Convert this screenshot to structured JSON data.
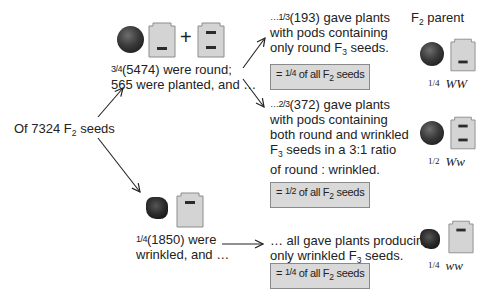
{
  "header": {
    "parent_label": "F",
    "parent_sub": "2",
    "parent_suffix": " parent"
  },
  "root": {
    "prefix": "Of 7324 F",
    "sub": "2",
    "suffix": " seeds"
  },
  "round_branch": {
    "frac": "3/4",
    "line1": "(5474) were round;",
    "line2": "565 were planted, and …",
    "plus": "+"
  },
  "wrinkled_branch": {
    "frac": "1/4",
    "line1": "(1850) were",
    "line2": "wrinkled, and …"
  },
  "outcomes": [
    {
      "lead": "…",
      "frac": "1/3",
      "line1": "(193) gave plants",
      "line2": "with pods containing",
      "line3_pre": "only round F",
      "line3_sub": "3",
      "line3_post": " seeds.",
      "box_pre": "= ",
      "box_frac": "1/4",
      "box_mid": " of all F",
      "box_sub": "2",
      "box_post": " seeds",
      "genotype_frac": "1/4",
      "genotype": "WW"
    },
    {
      "lead": "…",
      "frac": "2/3",
      "line1": "(372) gave plants",
      "line2": "with pods containing",
      "line3": "both round and wrinkled",
      "line4_pre": "F",
      "line4_sub": "3",
      "line4_post": " seeds in a 3:1 ratio",
      "line5": "of round : wrinkled.",
      "box_pre": "= ",
      "box_frac": "1/2",
      "box_mid": " of all F",
      "box_sub": "2",
      "box_post": " seeds",
      "genotype_frac": "1/2",
      "genotype": "Ww"
    },
    {
      "line1": "… all gave plants producing",
      "line2_pre": "only wrinkled F",
      "line2_sub": "3",
      "line2_post": " seeds.",
      "box_pre": "= ",
      "box_frac": "1/4",
      "box_mid": " of all F",
      "box_sub": "2",
      "box_post": " seeds",
      "genotype_frac": "1/4",
      "genotype": "ww"
    }
  ],
  "colors": {
    "box_fill": "#d9d9d9",
    "box_border": "#8a8a8a",
    "gene_fill": "#d4d4d4",
    "gene_border": "#8c8c8c",
    "allele_bar": "#2b2b2b"
  }
}
